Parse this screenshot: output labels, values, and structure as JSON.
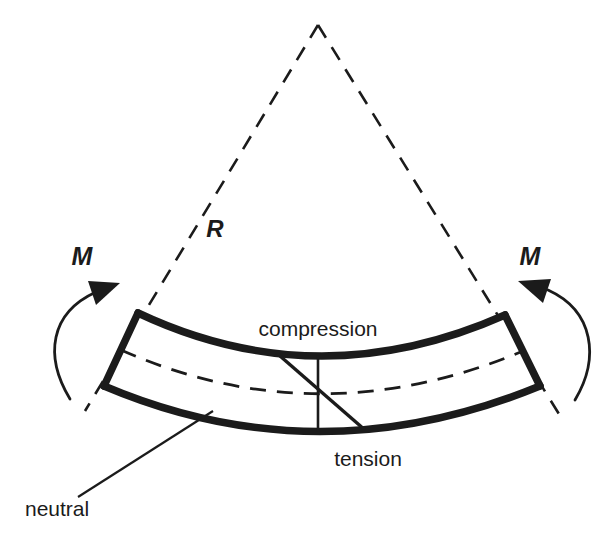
{
  "figure": {
    "kind": "engineering-diagram",
    "background_color": "#ffffff",
    "ink_color": "#1b1b1b",
    "shade_color": "#d9d9d9",
    "width": 606,
    "height": 538
  },
  "labels": {
    "compression": "compression",
    "tension": "tension",
    "neutral": "neutral",
    "moment_left": "M",
    "moment_right": "M",
    "radius": "R"
  },
  "annotations": {
    "compression_note": "Top fibre of the curved beam is in compression",
    "tension_note": "Bottom fibre of the curved beam is in tension",
    "neutral_note": "Leader line points to the dashed neutral axis inside the beam",
    "radius_note": "R is the radius of curvature measured from the apex to the neutral axis",
    "moment_note": "Equal and opposite applied bending moments M at each end"
  },
  "geometry": {
    "apex": [
      318,
      25
    ],
    "left_end_top": [
      138,
      313
    ],
    "left_end_bottom": [
      104,
      386
    ],
    "right_end_top": [
      505,
      315
    ],
    "right_end_bottom": [
      540,
      386
    ],
    "beam_mid_top": [
      318,
      352
    ],
    "beam_mid_bottom": [
      318,
      424
    ],
    "neutral_axis_mid": [
      318,
      390
    ],
    "leader_start": [
      78,
      497
    ],
    "leader_end": [
      213,
      411
    ],
    "radius_dash_left_tip": [
      85,
      411
    ],
    "radius_dash_right_tip": [
      559,
      414
    ]
  },
  "label_positions": {
    "compression": [
      318,
      336
    ],
    "tension": [
      368,
      466
    ],
    "neutral": [
      25,
      516
    ],
    "moment_left": [
      82,
      265
    ],
    "moment_right": [
      530,
      265
    ],
    "radius": [
      215,
      237
    ]
  }
}
